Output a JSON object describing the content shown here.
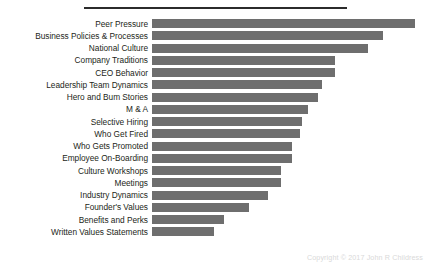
{
  "chart_data": {
    "type": "bar",
    "orientation": "horizontal",
    "title": "",
    "subtitle": "",
    "xlabel": "",
    "ylabel": "",
    "grid": false,
    "legend": null,
    "axis_visible": false,
    "value_labels_visible": false,
    "xlim": [
      0,
      100
    ],
    "bar_color": "#6e6e6e",
    "categories": [
      "Peer Pressure",
      "Business Policies & Processes",
      "National Culture",
      "Company Traditions",
      "CEO Behavior",
      "Leadership Team Dynamics",
      "Hero and Bum Stories",
      "M & A",
      "Selective Hiring",
      "Who Get Fired",
      "Who Gets Promoted",
      "Employee On-Boarding",
      "Culture Workshops",
      "Meetings",
      "Industry Dynamics",
      "Founder's Values",
      "Benefits and Perks",
      "Written Values Statements"
    ],
    "values": [
      100,
      87.8,
      82.1,
      69.5,
      69.5,
      64.6,
      63.2,
      59.5,
      57.3,
      56.5,
      53.4,
      53.4,
      49.2,
      49.2,
      44.3,
      37.0,
      27.5,
      23.7
    ],
    "bar_pixel_ends": [
      415,
      383,
      368,
      335,
      335,
      322,
      318,
      308,
      302,
      300,
      292,
      292,
      281,
      281,
      268,
      249,
      224,
      214
    ]
  },
  "decorations": {
    "top_rule": "horizontal-rule",
    "copyright": "Copyright © 2017 John R Childress"
  }
}
